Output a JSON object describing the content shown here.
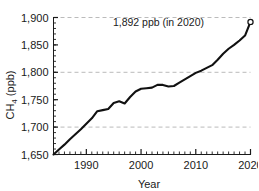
{
  "chart_data": {
    "type": "line",
    "title": "",
    "xlabel": "Year",
    "ylabel": "CH4 (ppb)",
    "ylabel_main": "CH",
    "ylabel_sub": "4",
    "ylabel_unit": " (ppb)",
    "xlim": [
      1984,
      2020
    ],
    "ylim": [
      1650,
      1900
    ],
    "yticks": [
      1650,
      1700,
      1750,
      1800,
      1850,
      1900
    ],
    "ytick_labels": [
      "1,650",
      "1,700",
      "1,750",
      "1,800",
      "1,850",
      "1,900"
    ],
    "xticks": [
      1990,
      2000,
      2010,
      2020
    ],
    "xtick_labels": [
      "1990",
      "2000",
      "2010",
      "2020"
    ],
    "x_minor_step": 1,
    "y_minor_step": 10,
    "gridlines_y": [
      1700,
      1800,
      1900
    ],
    "grid": true,
    "legend": null,
    "line_color": "#111111",
    "grid_color": "#bbbbbb",
    "axis_color": "#1a1a1a",
    "marker": {
      "type": "open-circle",
      "x": 2020,
      "y": 1892,
      "color": "#111111"
    },
    "annotations": [
      {
        "text": "1,892 ppb (in 2020)",
        "x": 2011.5,
        "y": 1884,
        "anchor": "end"
      }
    ],
    "series": [
      {
        "name": "CH4 concentration",
        "x": [
          1984,
          1985,
          1986,
          1987,
          1988,
          1989,
          1990,
          1991,
          1992,
          1993,
          1994,
          1995,
          1996,
          1997,
          1998,
          1999,
          2000,
          2001,
          2002,
          2003,
          2004,
          2005,
          2006,
          2007,
          2008,
          2009,
          2010,
          2011,
          2012,
          2013,
          2014,
          2015,
          2016,
          2017,
          2018,
          2019,
          2020
        ],
        "values": [
          1650,
          1659,
          1668,
          1678,
          1687,
          1696,
          1706,
          1716,
          1729,
          1731,
          1733,
          1744,
          1747,
          1743,
          1755,
          1765,
          1770,
          1771,
          1772,
          1777,
          1777,
          1774,
          1775,
          1781,
          1787,
          1793,
          1799,
          1803,
          1808,
          1813,
          1823,
          1834,
          1843,
          1850,
          1858,
          1867,
          1892
        ]
      }
    ]
  }
}
